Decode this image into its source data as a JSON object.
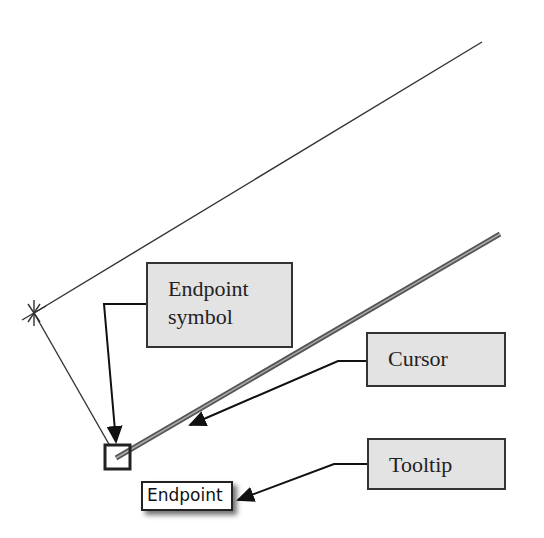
{
  "callouts": {
    "endpoint_symbol": {
      "line1": "Endpoint",
      "line2": "symbol"
    },
    "cursor": {
      "label": "Cursor"
    },
    "tooltip": {
      "label": "Tooltip"
    }
  },
  "tooltip": {
    "text": "Endpoint"
  },
  "colors": {
    "callout_fill": "#e3e3e3",
    "line": "#222222",
    "cursor_line": "#777777"
  }
}
